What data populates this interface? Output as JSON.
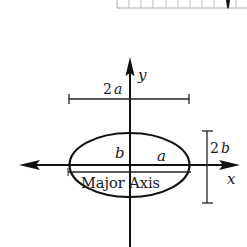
{
  "diagram": {
    "type": "ellipse-axes",
    "labels": {
      "y_axis": "y",
      "x_axis": "x",
      "width_dim_num": "2",
      "width_dim_var": "a",
      "height_dim_num": "2",
      "height_dim_var": "b",
      "semi_minor": "b",
      "semi_major": "a",
      "major_axis": "Major Axis"
    },
    "colors": {
      "stroke": "#111111",
      "ruler": "#9a9a9a",
      "marker": "#111111"
    },
    "top_strip": {
      "cells": 10,
      "marker_index": 9
    }
  }
}
